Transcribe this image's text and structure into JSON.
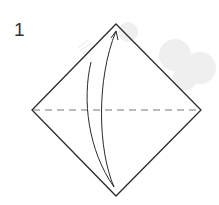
{
  "diagram": {
    "step_number": "1",
    "colors": {
      "outline": "#2a2a2a",
      "fold_line": "#777777",
      "arrow": "#2a2a2a",
      "watermark": "#ececec"
    },
    "shape": "square-diamond",
    "fold_line_type": "valley-fold-dashed",
    "arrow_direction": "bottom-to-top",
    "instruction": "Fold bottom corner up to top corner and unfold"
  }
}
